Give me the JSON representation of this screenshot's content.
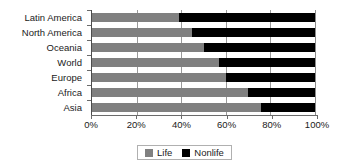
{
  "chart_data": {
    "type": "bar",
    "orientation": "horizontal",
    "stacked": true,
    "stack_mode": "percent",
    "title": "",
    "subtitle": "",
    "xlabel": "",
    "ylabel": "",
    "xlim": [
      0,
      100
    ],
    "xticks": [
      0,
      20,
      40,
      60,
      80,
      100
    ],
    "xticklabels": [
      "0%",
      "20%",
      "40%",
      "60%",
      "80%",
      "100%"
    ],
    "grid": true,
    "grid_axis": "x",
    "legend_position": "bottom",
    "categories": [
      "Latin America",
      "North America",
      "Oceania",
      "World",
      "Europe",
      "Africa",
      "Asia"
    ],
    "series": [
      {
        "name": "Life",
        "color": "#808080",
        "values": [
          39,
          45,
          50,
          57,
          60,
          70,
          76
        ]
      },
      {
        "name": "Nonlife",
        "color": "#000000",
        "values": [
          61,
          55,
          50,
          43,
          40,
          30,
          24
        ]
      }
    ]
  },
  "legend": {
    "entries": [
      {
        "label": "Life",
        "color": "#808080"
      },
      {
        "label": "Nonlife",
        "color": "#000000"
      }
    ]
  }
}
